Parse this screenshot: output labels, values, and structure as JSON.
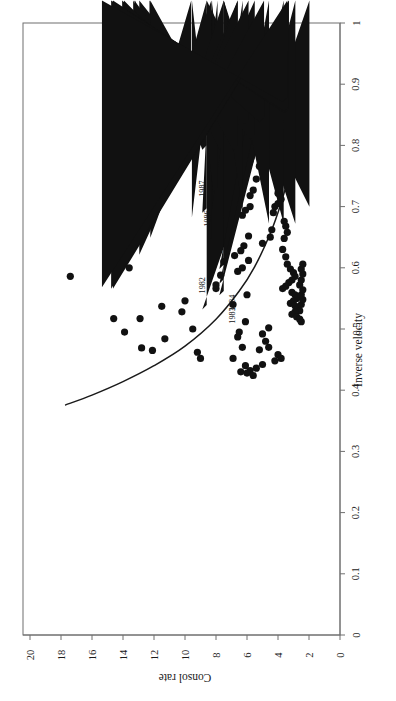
{
  "figure": {
    "title": "",
    "background": "#ffffff",
    "rotation_deg": 90,
    "frame_color": "#6f6f6f",
    "marker_color": "#111111",
    "curve_color": "#1a1a1a"
  },
  "axes": {
    "inverse_velocity": {
      "label": "Inverse velocity",
      "ticks": [
        "0",
        "0.1",
        "0.2",
        "0.3",
        "0.4",
        "0.5",
        "0.6",
        "0.7",
        "0.8",
        "0.9",
        "1"
      ],
      "min": 0,
      "max": 1
    },
    "consol_rate": {
      "label": "Consol rate",
      "ticks": [
        "0",
        "2",
        "4",
        "6",
        "8",
        "10",
        "12",
        "14",
        "16",
        "18",
        "20"
      ],
      "min": 0,
      "max": 20
    }
  },
  "chart_data": {
    "type": "scatter",
    "title": "",
    "xlabel": "Inverse velocity",
    "ylabel": "Consol rate",
    "xlim": [
      0,
      1
    ],
    "ylim": [
      0,
      20
    ],
    "grid": false,
    "legend": "none",
    "orientation": "rotated-90-ccw",
    "series": [
      {
        "name": "labelled-years",
        "marker": "diamond",
        "points": [
          {
            "label": "1982",
            "inverse_velocity": 0.532,
            "consol_rate": 8.6
          },
          {
            "label": "1983",
            "inverse_velocity": 0.555,
            "consol_rate": 7.5
          },
          {
            "label": "1984",
            "inverse_velocity": 0.574,
            "consol_rate": 7.5
          },
          {
            "label": "1985",
            "inverse_velocity": 0.598,
            "consol_rate": 7.5
          },
          {
            "label": "1986",
            "inverse_velocity": 0.641,
            "consol_rate": 8.3
          },
          {
            "label": "1987",
            "inverse_velocity": 0.69,
            "consol_rate": 8.6
          },
          {
            "label": "1988",
            "inverse_velocity": 0.724,
            "consol_rate": 7.9
          },
          {
            "label": "1989",
            "inverse_velocity": 0.793,
            "consol_rate": 8.6
          },
          {
            "label": "1990",
            "inverse_velocity": 0.817,
            "consol_rate": 9.6
          },
          {
            "label": "1991",
            "inverse_velocity": 0.82,
            "consol_rate": 8.3
          },
          {
            "label": "1992",
            "inverse_velocity": 0.793,
            "consol_rate": 7.5
          },
          {
            "label": "1993",
            "inverse_velocity": 0.81,
            "consol_rate": 5.5
          },
          {
            "label": "1994",
            "inverse_velocity": 0.818,
            "consol_rate": 6.6
          },
          {
            "label": "1995",
            "inverse_velocity": 0.792,
            "consol_rate": 6.6
          },
          {
            "label": "1996",
            "inverse_velocity": 0.835,
            "consol_rate": 5.9
          },
          {
            "label": "1997",
            "inverse_velocity": 0.838,
            "consol_rate": 4.9
          },
          {
            "label": "1998",
            "inverse_velocity": 0.853,
            "consol_rate": 3.3
          },
          {
            "label": "1999",
            "inverse_velocity": 0.856,
            "consol_rate": 3.3
          },
          {
            "label": "2000",
            "inverse_velocity": 0.871,
            "consol_rate": 3.4
          }
        ]
      },
      {
        "name": "historical-observations",
        "marker": "circle",
        "points": [
          {
            "inverse_velocity": 0.586,
            "consol_rate": 17.4
          },
          {
            "inverse_velocity": 0.6,
            "consol_rate": 13.6
          },
          {
            "inverse_velocity": 0.517,
            "consol_rate": 14.6
          },
          {
            "inverse_velocity": 0.517,
            "consol_rate": 12.9
          },
          {
            "inverse_velocity": 0.495,
            "consol_rate": 13.9
          },
          {
            "inverse_velocity": 0.469,
            "consol_rate": 12.8
          },
          {
            "inverse_velocity": 0.465,
            "consol_rate": 12.1
          },
          {
            "inverse_velocity": 0.484,
            "consol_rate": 11.3
          },
          {
            "inverse_velocity": 0.537,
            "consol_rate": 11.5
          },
          {
            "inverse_velocity": 0.528,
            "consol_rate": 10.2
          },
          {
            "inverse_velocity": 0.546,
            "consol_rate": 10.0
          },
          {
            "inverse_velocity": 0.5,
            "consol_rate": 9.5
          },
          {
            "inverse_velocity": 0.462,
            "consol_rate": 9.2
          },
          {
            "inverse_velocity": 0.452,
            "consol_rate": 9.0
          },
          {
            "inverse_velocity": 0.566,
            "consol_rate": 8.0
          },
          {
            "inverse_velocity": 0.572,
            "consol_rate": 8.0
          },
          {
            "inverse_velocity": 0.588,
            "consol_rate": 7.7
          },
          {
            "inverse_velocity": 0.61,
            "consol_rate": 7.5
          },
          {
            "inverse_velocity": 0.644,
            "consol_rate": 7.4
          },
          {
            "inverse_velocity": 0.657,
            "consol_rate": 7.2
          },
          {
            "inverse_velocity": 0.54,
            "consol_rate": 6.9
          },
          {
            "inverse_velocity": 0.487,
            "consol_rate": 6.6
          },
          {
            "inverse_velocity": 0.495,
            "consol_rate": 6.5
          },
          {
            "inverse_velocity": 0.47,
            "consol_rate": 6.3
          },
          {
            "inverse_velocity": 0.512,
            "consol_rate": 6.1
          },
          {
            "inverse_velocity": 0.556,
            "consol_rate": 6.0
          },
          {
            "inverse_velocity": 0.612,
            "consol_rate": 5.9
          },
          {
            "inverse_velocity": 0.652,
            "consol_rate": 5.9
          },
          {
            "inverse_velocity": 0.7,
            "consol_rate": 5.8
          },
          {
            "inverse_velocity": 0.718,
            "consol_rate": 5.8
          },
          {
            "inverse_velocity": 0.727,
            "consol_rate": 5.6
          },
          {
            "inverse_velocity": 0.745,
            "consol_rate": 5.4
          },
          {
            "inverse_velocity": 0.766,
            "consol_rate": 5.2
          },
          {
            "inverse_velocity": 0.8,
            "consol_rate": 5.0
          },
          {
            "inverse_velocity": 0.816,
            "consol_rate": 4.6
          },
          {
            "inverse_velocity": 0.836,
            "consol_rate": 4.3
          },
          {
            "inverse_velocity": 0.853,
            "consol_rate": 4.1
          },
          {
            "inverse_velocity": 0.905,
            "consol_rate": 3.0
          },
          {
            "inverse_velocity": 0.924,
            "consol_rate": 2.6
          },
          {
            "inverse_velocity": 0.64,
            "consol_rate": 5.0
          },
          {
            "inverse_velocity": 0.65,
            "consol_rate": 4.5
          },
          {
            "inverse_velocity": 0.662,
            "consol_rate": 4.4
          },
          {
            "inverse_velocity": 0.69,
            "consol_rate": 4.3
          },
          {
            "inverse_velocity": 0.7,
            "consol_rate": 4.2
          },
          {
            "inverse_velocity": 0.705,
            "consol_rate": 4.0
          },
          {
            "inverse_velocity": 0.712,
            "consol_rate": 3.8
          },
          {
            "inverse_velocity": 0.722,
            "consol_rate": 4.0
          },
          {
            "inverse_velocity": 0.676,
            "consol_rate": 3.6
          },
          {
            "inverse_velocity": 0.668,
            "consol_rate": 3.5
          },
          {
            "inverse_velocity": 0.658,
            "consol_rate": 3.4
          },
          {
            "inverse_velocity": 0.648,
            "consol_rate": 3.6
          },
          {
            "inverse_velocity": 0.63,
            "consol_rate": 3.7
          },
          {
            "inverse_velocity": 0.618,
            "consol_rate": 3.5
          },
          {
            "inverse_velocity": 0.606,
            "consol_rate": 3.4
          },
          {
            "inverse_velocity": 0.598,
            "consol_rate": 3.2
          },
          {
            "inverse_velocity": 0.592,
            "consol_rate": 3.0
          },
          {
            "inverse_velocity": 0.586,
            "consol_rate": 2.9
          },
          {
            "inverse_velocity": 0.58,
            "consol_rate": 3.1
          },
          {
            "inverse_velocity": 0.576,
            "consol_rate": 3.3
          },
          {
            "inverse_velocity": 0.57,
            "consol_rate": 3.5
          },
          {
            "inverse_velocity": 0.566,
            "consol_rate": 3.7
          },
          {
            "inverse_velocity": 0.56,
            "consol_rate": 3.1
          },
          {
            "inverse_velocity": 0.556,
            "consol_rate": 2.9
          },
          {
            "inverse_velocity": 0.55,
            "consol_rate": 2.8
          },
          {
            "inverse_velocity": 0.546,
            "consol_rate": 3.0
          },
          {
            "inverse_velocity": 0.542,
            "consol_rate": 3.2
          },
          {
            "inverse_velocity": 0.538,
            "consol_rate": 2.9
          },
          {
            "inverse_velocity": 0.534,
            "consol_rate": 2.7
          },
          {
            "inverse_velocity": 0.53,
            "consol_rate": 2.6
          },
          {
            "inverse_velocity": 0.528,
            "consol_rate": 2.9
          },
          {
            "inverse_velocity": 0.524,
            "consol_rate": 3.1
          },
          {
            "inverse_velocity": 0.52,
            "consol_rate": 2.8
          },
          {
            "inverse_velocity": 0.516,
            "consol_rate": 2.6
          },
          {
            "inverse_velocity": 0.512,
            "consol_rate": 2.5
          },
          {
            "inverse_velocity": 0.54,
            "consol_rate": 2.5
          },
          {
            "inverse_velocity": 0.548,
            "consol_rate": 2.4
          },
          {
            "inverse_velocity": 0.556,
            "consol_rate": 2.5
          },
          {
            "inverse_velocity": 0.564,
            "consol_rate": 2.4
          },
          {
            "inverse_velocity": 0.572,
            "consol_rate": 2.6
          },
          {
            "inverse_velocity": 0.58,
            "consol_rate": 2.5
          },
          {
            "inverse_velocity": 0.59,
            "consol_rate": 2.4
          },
          {
            "inverse_velocity": 0.598,
            "consol_rate": 2.5
          },
          {
            "inverse_velocity": 0.606,
            "consol_rate": 2.4
          },
          {
            "inverse_velocity": 0.458,
            "consol_rate": 4.0
          },
          {
            "inverse_velocity": 0.452,
            "consol_rate": 3.8
          },
          {
            "inverse_velocity": 0.448,
            "consol_rate": 4.2
          },
          {
            "inverse_velocity": 0.47,
            "consol_rate": 4.6
          },
          {
            "inverse_velocity": 0.48,
            "consol_rate": 4.8
          },
          {
            "inverse_velocity": 0.492,
            "consol_rate": 5.0
          },
          {
            "inverse_velocity": 0.502,
            "consol_rate": 4.6
          },
          {
            "inverse_velocity": 0.466,
            "consol_rate": 5.2
          },
          {
            "inverse_velocity": 0.442,
            "consol_rate": 5.0
          },
          {
            "inverse_velocity": 0.436,
            "consol_rate": 5.4
          },
          {
            "inverse_velocity": 0.432,
            "consol_rate": 5.8
          },
          {
            "inverse_velocity": 0.44,
            "consol_rate": 6.1
          },
          {
            "inverse_velocity": 0.452,
            "consol_rate": 6.9
          },
          {
            "inverse_velocity": 0.43,
            "consol_rate": 6.4
          },
          {
            "inverse_velocity": 0.428,
            "consol_rate": 6.0
          },
          {
            "inverse_velocity": 0.424,
            "consol_rate": 5.6
          },
          {
            "inverse_velocity": 0.62,
            "consol_rate": 6.8
          },
          {
            "inverse_velocity": 0.628,
            "consol_rate": 6.4
          },
          {
            "inverse_velocity": 0.636,
            "consol_rate": 6.2
          },
          {
            "inverse_velocity": 0.6,
            "consol_rate": 6.3
          },
          {
            "inverse_velocity": 0.594,
            "consol_rate": 6.6
          },
          {
            "inverse_velocity": 0.686,
            "consol_rate": 6.3
          },
          {
            "inverse_velocity": 0.694,
            "consol_rate": 6.1
          },
          {
            "inverse_velocity": 0.76,
            "consol_rate": 4.0
          },
          {
            "inverse_velocity": 0.772,
            "consol_rate": 3.8
          }
        ]
      }
    ],
    "fitted_curve": {
      "name": "liquidity-preference-fit",
      "points": [
        {
          "consol_rate": 17.7,
          "inverse_velocity": 0.376
        },
        {
          "consol_rate": 16.0,
          "inverse_velocity": 0.392
        },
        {
          "consol_rate": 14.0,
          "inverse_velocity": 0.414
        },
        {
          "consol_rate": 12.0,
          "inverse_velocity": 0.44
        },
        {
          "consol_rate": 10.0,
          "inverse_velocity": 0.472
        },
        {
          "consol_rate": 8.0,
          "inverse_velocity": 0.516
        },
        {
          "consol_rate": 6.5,
          "inverse_velocity": 0.562
        },
        {
          "consol_rate": 5.5,
          "inverse_velocity": 0.602
        },
        {
          "consol_rate": 4.5,
          "inverse_velocity": 0.656
        },
        {
          "consol_rate": 3.8,
          "inverse_velocity": 0.706
        },
        {
          "consol_rate": 3.2,
          "inverse_velocity": 0.76
        },
        {
          "consol_rate": 2.8,
          "inverse_velocity": 0.805
        },
        {
          "consol_rate": 2.3,
          "inverse_velocity": 0.857
        }
      ]
    }
  }
}
